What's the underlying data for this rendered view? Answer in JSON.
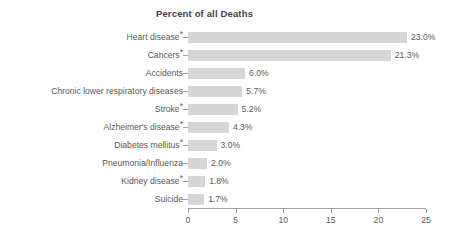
{
  "chart_data": {
    "type": "bar",
    "orientation": "horizontal",
    "title": "Percent of all Deaths",
    "xlabel": "",
    "ylabel": "",
    "xlim": [
      0,
      25
    ],
    "grid": false,
    "legend": null,
    "bar_color": "#d5d6d7",
    "text_color": "#58595b",
    "axis_color": "#9d9fa2",
    "value_suffix": "%",
    "xticks": [
      0,
      5,
      10,
      15,
      20,
      25
    ],
    "xtick_labels": [
      "0",
      "5",
      "10",
      "15",
      "20",
      "25"
    ],
    "categories": [
      "Heart disease",
      "Cancers",
      "Accidents",
      "Chronic lower respiratory diseases",
      "Stroke",
      "Alzheimer's disease",
      "Diabetes mellitus",
      "Pneumonia/Influenza",
      "Kidney disease",
      "Suicide"
    ],
    "category_footnote_marks": [
      "*",
      "*",
      "",
      "",
      "*",
      "*",
      "*",
      "",
      "*",
      ""
    ],
    "values": [
      23.0,
      21.3,
      6.0,
      5.7,
      5.2,
      4.3,
      3.0,
      2.0,
      1.8,
      1.7
    ],
    "value_labels": [
      "23.0%",
      "21.3%",
      "6.0%",
      "5.7%",
      "5.2%",
      "4.3%",
      "3.0%",
      "2.0%",
      "1.8%",
      "1.7%"
    ]
  }
}
